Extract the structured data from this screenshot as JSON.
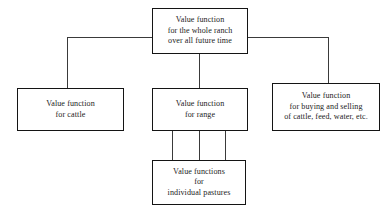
{
  "diagram": {
    "nodes": [
      {
        "id": "root",
        "name": "value-function-whole-ranch",
        "lines": [
          "Value function",
          "for the whole ranch",
          "over all future time"
        ]
      },
      {
        "id": "cattle",
        "name": "value-function-cattle",
        "lines": [
          "Value function",
          "for cattle"
        ]
      },
      {
        "id": "range",
        "name": "value-function-range",
        "lines": [
          "Value function",
          "for range"
        ]
      },
      {
        "id": "buysell",
        "name": "value-function-buying-selling",
        "lines": [
          "Value function",
          "for buying and selling",
          "of cattle, feed, water, etc."
        ]
      },
      {
        "id": "pastures",
        "name": "value-functions-individual-pastures",
        "lines": [
          "Value functions",
          "for",
          "individual pastures"
        ]
      }
    ],
    "colors": {
      "background": "#ffffff",
      "box_border": "#141414",
      "connector": "#3a3a3a",
      "text": "#1c1c1c"
    }
  }
}
